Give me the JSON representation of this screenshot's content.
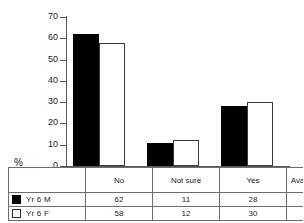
{
  "chart_data": {
    "type": "bar",
    "title": "",
    "xlabel": "",
    "ylabel": "%",
    "ylim": [
      0,
      70
    ],
    "yticks": [
      0,
      10,
      20,
      30,
      40,
      50,
      60,
      70
    ],
    "ytick_labels": [
      "0",
      "10",
      "20",
      "30",
      "40",
      "50",
      "60",
      "70"
    ],
    "grid": false,
    "legend_position": "bottom-table",
    "categories": [
      "No",
      "Not sure",
      "Yes"
    ],
    "series": [
      {
        "name": "Yr 6 M",
        "values": [
          62,
          11,
          28
        ],
        "color": "#000000",
        "sample": 3303
      },
      {
        "name": "Yr 6 F",
        "values": [
          58,
          12,
          30
        ],
        "color": "#ffffff",
        "sample": 3285
      }
    ]
  },
  "axis": {
    "percent_symbol": "%"
  },
  "table": {
    "header_blank": "",
    "headers": [
      "No",
      "Not sure",
      "Yes",
      "Available sample"
    ],
    "rows": [
      {
        "label": "Yr 6 M",
        "swatch": "filled-square-icon",
        "cells": [
          "62",
          "11",
          "28",
          "3303"
        ]
      },
      {
        "label": "Yr 6 F",
        "swatch": "hollow-square-icon",
        "cells": [
          "58",
          "12",
          "30",
          "3285"
        ]
      }
    ]
  }
}
